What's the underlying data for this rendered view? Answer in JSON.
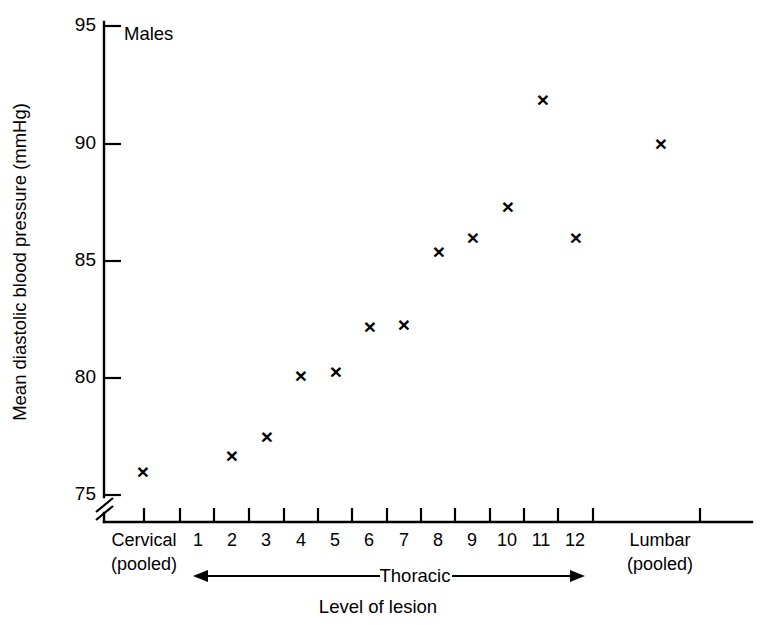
{
  "chart_data": {
    "type": "scatter",
    "title": "",
    "panel_label": "Males",
    "xlabel": "Level of lesion",
    "ylabel": "Mean diastolic blood pressure (mmHg)",
    "ylim": [
      74,
      95
    ],
    "yticks": [
      75,
      80,
      85,
      90,
      95
    ],
    "ytick_labels": [
      "75",
      "80",
      "85",
      "90",
      "95"
    ],
    "y_axis_break": true,
    "grid": false,
    "legend": "none",
    "marker": "x",
    "marker_color": "#000000",
    "categories": [
      "Cervical (pooled)",
      "1",
      "2",
      "3",
      "4",
      "5",
      "6",
      "7",
      "8",
      "9",
      "10",
      "11",
      "12",
      "Lumbar (pooled)"
    ],
    "xtick_labels": [
      {
        "line1": "Cervical",
        "line2": "(pooled)"
      },
      {
        "line1": "1",
        "line2": ""
      },
      {
        "line1": "2",
        "line2": ""
      },
      {
        "line1": "3",
        "line2": ""
      },
      {
        "line1": "4",
        "line2": ""
      },
      {
        "line1": "5",
        "line2": ""
      },
      {
        "line1": "6",
        "line2": ""
      },
      {
        "line1": "7",
        "line2": ""
      },
      {
        "line1": "8",
        "line2": ""
      },
      {
        "line1": "9",
        "line2": ""
      },
      {
        "line1": "10",
        "line2": ""
      },
      {
        "line1": "11",
        "line2": ""
      },
      {
        "line1": "12",
        "line2": ""
      },
      {
        "line1": "Lumbar",
        "line2": "(pooled)"
      }
    ],
    "values": [
      75.9,
      null,
      76.6,
      77.4,
      80.0,
      80.2,
      82.1,
      82.2,
      85.3,
      85.9,
      87.2,
      91.8,
      85.9,
      89.9
    ],
    "points": [
      {
        "category": "Cervical (pooled)",
        "value": 75.9
      },
      {
        "category": "2",
        "value": 76.6
      },
      {
        "category": "3",
        "value": 77.4
      },
      {
        "category": "4",
        "value": 80.0
      },
      {
        "category": "5",
        "value": 80.2
      },
      {
        "category": "6",
        "value": 82.1
      },
      {
        "category": "7",
        "value": 82.2
      },
      {
        "category": "8",
        "value": 85.3
      },
      {
        "category": "9",
        "value": 85.9
      },
      {
        "category": "10",
        "value": 87.2
      },
      {
        "category": "11",
        "value": 91.8
      },
      {
        "category": "12",
        "value": 85.9
      },
      {
        "category": "Lumbar (pooled)",
        "value": 89.9
      }
    ],
    "annotations": [
      {
        "name": "thoracic-range",
        "label": "Thoracic",
        "from": "1",
        "to": "12",
        "style": "double-arrow"
      }
    ]
  }
}
